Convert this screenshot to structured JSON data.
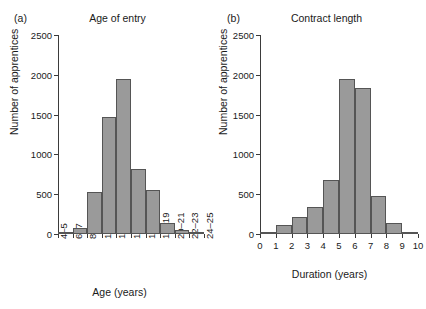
{
  "figure": {
    "background": "#ffffff",
    "bar_fill": "#9a9a9a",
    "bar_stroke": "#555555",
    "axis_color": "#3b3b3b"
  },
  "panels": [
    {
      "letter": "(a)",
      "title": "Age of entry",
      "xlabel": "Age (years)",
      "ylabel": "Number of apprentices",
      "yticks": [
        "0",
        "500",
        "1000",
        "1500",
        "2000",
        "2500"
      ],
      "xticks": [
        "4–5",
        "6–7",
        "8–9",
        "10–11",
        "12–13",
        "14–15",
        "16–17",
        "18–19",
        "20–21",
        "22–23",
        "24–25"
      ]
    },
    {
      "letter": "(b)",
      "title": "Contract length",
      "xlabel": "Duration (years)",
      "ylabel": "Number of apprentices",
      "yticks": [
        "0",
        "500",
        "1000",
        "1500",
        "2000",
        "2500"
      ],
      "xticks": [
        "0",
        "1",
        "2",
        "3",
        "4",
        "5",
        "6",
        "7",
        "8",
        "9",
        "10"
      ]
    }
  ],
  "chart_data": [
    {
      "type": "bar",
      "title": "Age of entry",
      "panel": "(a)",
      "xlabel": "Age (years)",
      "ylabel": "Number of apprentices",
      "categories": [
        "4–5",
        "6–7",
        "8–9",
        "10–11",
        "12–13",
        "14–15",
        "16–17",
        "18–19",
        "20–21",
        "22–23",
        "24–25"
      ],
      "bin_edges": [
        "4–5",
        "6–7",
        "8–9",
        "10–11",
        "12–13",
        "14–15",
        "16–17",
        "18–19",
        "20–21",
        "22–23",
        "24–25"
      ],
      "values": [
        10,
        70,
        525,
        1470,
        1950,
        820,
        550,
        140,
        50,
        15
      ],
      "ylim": [
        0,
        2500
      ],
      "yticks": [
        0,
        500,
        1000,
        1500,
        2000,
        2500
      ],
      "grid": false,
      "legend": null
    },
    {
      "type": "bar",
      "title": "Contract length",
      "panel": "(b)",
      "xlabel": "Duration (years)",
      "ylabel": "Number of apprentices",
      "categories": [
        "0–1",
        "1–2",
        "2–3",
        "3–4",
        "4–5",
        "5–6",
        "6–7",
        "7–8",
        "8–9",
        "9–10"
      ],
      "bin_edges": [
        0,
        1,
        2,
        3,
        4,
        5,
        6,
        7,
        8,
        9,
        10
      ],
      "values": [
        30,
        115,
        210,
        345,
        675,
        1950,
        1830,
        480,
        135,
        10
      ],
      "xlim": [
        0,
        10
      ],
      "ylim": [
        0,
        2500
      ],
      "yticks": [
        0,
        500,
        1000,
        1500,
        2000,
        2500
      ],
      "xticks": [
        0,
        1,
        2,
        3,
        4,
        5,
        6,
        7,
        8,
        9,
        10
      ],
      "grid": false,
      "legend": null
    }
  ]
}
